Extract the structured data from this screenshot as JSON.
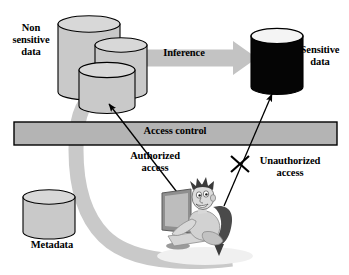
{
  "diagram": {
    "background_color": "#ffffff",
    "labels": {
      "non_sensitive_data": "Non\nsensitive\ndata",
      "sensitive_data": "Sensitive\ndata",
      "inference": "Inference",
      "access_control": "Access control",
      "authorized_access": "Authorized\naccess",
      "unauthorized_access": "Unauthorized\naccess",
      "metadata": "Metadata"
    },
    "colors": {
      "cylinder_fill": "#c9c9c9",
      "cylinder_top": "#d8d8d8",
      "sensitive_fill": "#050505",
      "sensitive_top": "#f2f2f2",
      "bar_fill": "#b4b4b4",
      "block_arrow": "#c3c3c3",
      "curved_arrow": "#c9c9c9",
      "outline": "#000000",
      "person_skin": "#d5d5d5",
      "monitor": "#9a9a9a"
    },
    "shapes": {
      "nonsensitive_cylinders": [
        {
          "name": "cylinder-back-left",
          "cx": 89,
          "top": 16,
          "width": 62,
          "height": 76,
          "fill": "#c9c9c9"
        },
        {
          "name": "cylinder-back-right",
          "cx": 121,
          "top": 37,
          "width": 52,
          "height": 62,
          "fill": "#c9c9c9"
        },
        {
          "name": "cylinder-front",
          "cx": 107,
          "top": 62,
          "width": 56,
          "height": 52,
          "fill": "#c9c9c9"
        }
      ],
      "sensitive_cylinder": {
        "name": "cylinder-sensitive",
        "cx": 277,
        "top": 28,
        "width": 52,
        "height": 66,
        "fill": "#050505"
      },
      "metadata_cylinder": {
        "name": "cylinder-metadata",
        "cx": 49,
        "top": 190,
        "width": 52,
        "height": 48,
        "fill": "#c9c9c9"
      },
      "access_control_bar": {
        "x": 14,
        "y": 122,
        "width": 323,
        "height": 23,
        "fill": "#b4b4b4"
      },
      "inference_arrow": {
        "x1": 123,
        "y1": 58,
        "x2": 256,
        "y2": 58,
        "thickness": 17,
        "head_width": 36,
        "head_height": 34
      }
    },
    "annotations": {
      "authorized_arrow": {
        "from": [
          190,
          208
        ],
        "to": [
          107,
          101
        ],
        "style": "thin-solid-arrow",
        "blocked": false
      },
      "unauthorized_arrow": {
        "from": [
          225,
          205
        ],
        "to": [
          272,
          93
        ],
        "style": "thin-solid-arrow",
        "blocked": true,
        "block_marker": "x-cross"
      },
      "curved_feed_arrow": {
        "description": "thick gray curved band from person/metadata area around to non-sensitive data store"
      }
    }
  }
}
